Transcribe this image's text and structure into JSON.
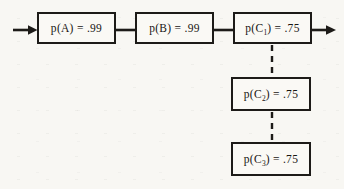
{
  "diagram": {
    "type": "reliability-block-diagram",
    "background_color": "#f8f7f3",
    "line_color": "#1d1b18",
    "nodes": [
      {
        "id": "A",
        "pre": "p(A) = .99",
        "sub": "",
        "post": "",
        "probability": 0.99
      },
      {
        "id": "B",
        "pre": "p(B) = .99",
        "sub": "",
        "post": "",
        "probability": 0.99
      },
      {
        "id": "C1",
        "pre": "p(C",
        "sub": "1",
        "post": ") = .75",
        "probability": 0.75
      },
      {
        "id": "C2",
        "pre": "p(C",
        "sub": "2",
        "post": ") = .75",
        "probability": 0.75
      },
      {
        "id": "C3",
        "pre": "p(C",
        "sub": "3",
        "post": ") = .75",
        "probability": 0.75
      }
    ],
    "edges": [
      {
        "from": "input",
        "to": "A",
        "style": "solid-arrow"
      },
      {
        "from": "A",
        "to": "B",
        "style": "solid"
      },
      {
        "from": "B",
        "to": "C1",
        "style": "solid"
      },
      {
        "from": "C1",
        "to": "output",
        "style": "solid-arrow"
      },
      {
        "from": "C1",
        "to": "C2",
        "style": "dashed"
      },
      {
        "from": "C2",
        "to": "C3",
        "style": "dashed"
      }
    ]
  }
}
